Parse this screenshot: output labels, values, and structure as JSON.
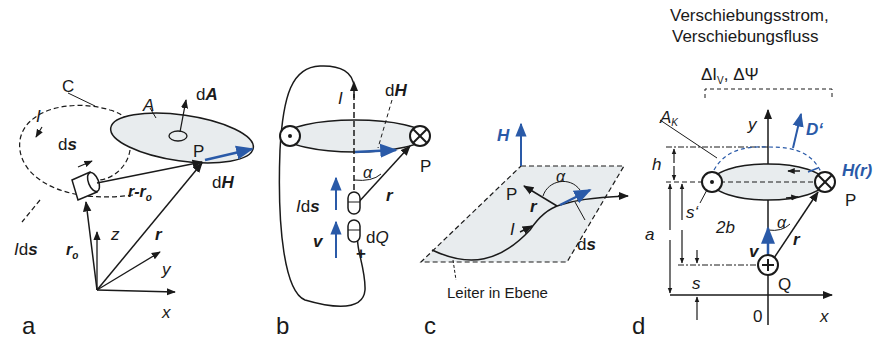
{
  "figure": {
    "colors": {
      "ink": "#1a1a1a",
      "vector_blue": "#2a5aa8",
      "fill": "#e8ecee"
    },
    "panels": [
      {
        "id": "a",
        "label": "a",
        "labels": {
          "contour": "C",
          "current": "I",
          "area": "A",
          "area_element": "dA",
          "path_element": "ds",
          "point": "P",
          "field_element": "dH",
          "difference_vector": "r-r",
          "difference_sub": "o",
          "current_element": "Ids",
          "r0": "r",
          "r0_sub": "o",
          "r": "r",
          "axis_x": "x",
          "axis_y": "y",
          "axis_z": "z"
        }
      },
      {
        "id": "b",
        "label": "b",
        "labels": {
          "current": "I",
          "field_element": "dH",
          "point": "P",
          "angle": "α",
          "r": "r",
          "current_element": "Ids",
          "velocity": "v",
          "charge": "dQ",
          "plus": "+"
        }
      },
      {
        "id": "c",
        "label": "c",
        "labels": {
          "field": "H",
          "angle": "α",
          "point": "P",
          "r": "r",
          "current": "I",
          "path_element": "ds",
          "caption": "Leiter in Ebene"
        }
      },
      {
        "id": "d",
        "label": "d",
        "labels": {
          "title_line1": "Verschiebungsstrom,",
          "title_line2": "Verschiebungsfluss",
          "quantities": "ΔI",
          "quantities_sub": "V",
          "quantities_rest": ", ΔΨ",
          "area": "A",
          "area_sub": "K",
          "axis_y": "y",
          "displacement": "D‘",
          "field": "H(r)",
          "height": "h",
          "width": "2b",
          "point": "P",
          "s_prime": "s‘",
          "angle": "α",
          "distance_a": "a",
          "r": "r",
          "velocity": "v",
          "s": "s",
          "charge": "Q",
          "origin": "0",
          "axis_x": "x"
        }
      }
    ]
  }
}
